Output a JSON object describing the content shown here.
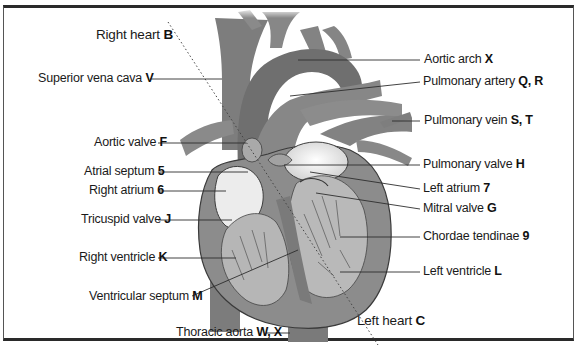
{
  "diagram": {
    "type": "anatomical-labeled-illustration",
    "colors": {
      "frame": "#2a2a2a",
      "heart_wall": "#8a8a8a",
      "vessel": "#7c7c7c",
      "chamber_interior": "#b8b8b8",
      "chamber_light": "#e4e4e4",
      "label_text": "#1a1a1a",
      "leader_line": "#333333"
    },
    "divider": {
      "style": "dotted",
      "from": "upper-left",
      "to": "lower-right"
    },
    "labels_left": [
      {
        "name": "Right heart",
        "key": "B"
      },
      {
        "name": "Superior vena cava",
        "key": "V"
      },
      {
        "name": "Aortic valve",
        "key": "F"
      },
      {
        "name": "Atrial septum",
        "key": "5"
      },
      {
        "name": "Right atrium",
        "key": "6"
      },
      {
        "name": "Tricuspid valve",
        "key": "J"
      },
      {
        "name": "Right ventricle",
        "key": "K"
      },
      {
        "name": "Ventricular septum",
        "key": "M"
      },
      {
        "name": "Thoracic aorta",
        "key": "W, X"
      }
    ],
    "labels_right": [
      {
        "name": "Aortic arch",
        "key": "X"
      },
      {
        "name": "Pulmonary artery",
        "key": "Q, R"
      },
      {
        "name": "Pulmonary vein",
        "key": "S, T"
      },
      {
        "name": "Pulmonary valve",
        "key": "H"
      },
      {
        "name": "Left atrium",
        "key": "7"
      },
      {
        "name": "Mitral valve",
        "key": "G"
      },
      {
        "name": "Chordae tendinae",
        "key": "9"
      },
      {
        "name": "Left ventricle",
        "key": "L"
      },
      {
        "name": "Left heart",
        "key": "C"
      }
    ]
  }
}
